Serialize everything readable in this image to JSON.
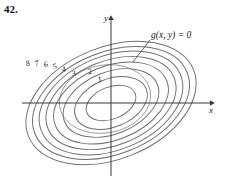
{
  "figure": {
    "problem_number": "42.",
    "caption_label": "g(x, y) = 0",
    "axes": {
      "x_label": "x",
      "y_label": "y",
      "origin": [
        111,
        103
      ],
      "x_axis_from": [
        22,
        103
      ],
      "x_axis_to": [
        214,
        103
      ],
      "y_axis_from": [
        111,
        175
      ],
      "y_axis_to": [
        111,
        16
      ]
    },
    "stroke_color": "#6e6e6e",
    "axis_color": "#3a3a3a",
    "constraint_color": "#9a9a9a",
    "text_color": "#1a1a1a",
    "background": "#ffffff"
  },
  "chart_data": {
    "type": "contour",
    "title": "",
    "xlabel": "x",
    "ylabel": "y",
    "grid": false,
    "legend": "none",
    "level_labels": [
      "1",
      "2",
      "3",
      "4",
      "5",
      "6",
      "7",
      "8"
    ],
    "contours": [
      {
        "level": "1",
        "rx": 26,
        "ry": 16,
        "label_x": 98,
        "label_y": 76
      },
      {
        "level": "2",
        "rx": 38,
        "ry": 24,
        "label_x": 88,
        "label_y": 68
      },
      {
        "level": "3",
        "rx": 50,
        "ry": 31,
        "label_x": 72,
        "label_y": 70
      },
      {
        "level": "4",
        "rx": 60,
        "ry": 37,
        "label_x": 62,
        "label_y": 66
      },
      {
        "level": "5",
        "rx": 68,
        "ry": 42,
        "label_x": 53,
        "label_y": 63
      },
      {
        "level": "6",
        "rx": 75,
        "ry": 47,
        "label_x": 44,
        "label_y": 61
      },
      {
        "level": "7",
        "rx": 82,
        "ry": 51,
        "label_x": 35,
        "label_y": 60
      },
      {
        "level": "8",
        "rx": 89,
        "ry": 56,
        "label_x": 26,
        "label_y": 60
      }
    ],
    "ellipse_rotation_deg": -22,
    "ellipse_center": [
      111,
      103
    ],
    "constraint_curve": {
      "label": "g(x, y) = 0",
      "center": [
        105,
        99
      ],
      "rx": 46,
      "ry": 34,
      "rotation_deg": -10,
      "label_x": 151,
      "label_y": 31,
      "leader_from": [
        150,
        40
      ],
      "leader_to": [
        133,
        62
      ]
    }
  }
}
